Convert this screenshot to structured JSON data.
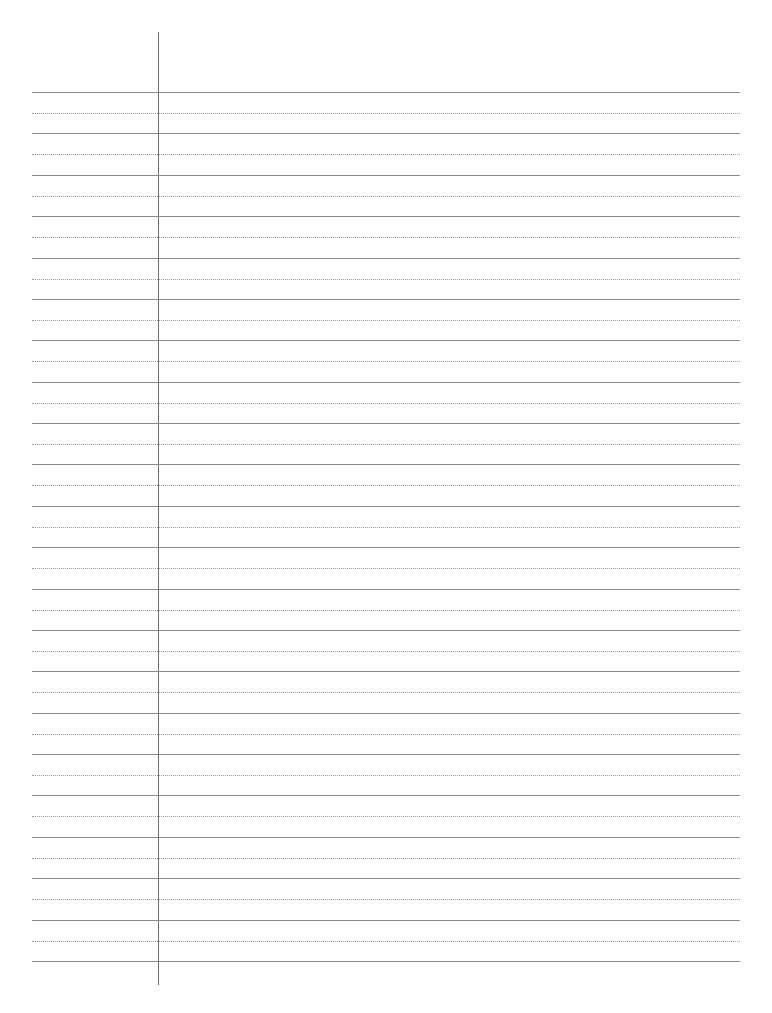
{
  "sheet": {
    "type": "lined-paper",
    "background_color": "#ffffff",
    "rule_color": "#8a8a8a",
    "dotted_rule_color": "#9a9a9a",
    "margin_line_color": "#6e6e6e",
    "solid_rule_count": 22,
    "dotted_rule_count": 21,
    "first_rule_y": 92,
    "rule_spacing": 41.38,
    "rule_left": 32,
    "rule_right": 740,
    "margin_line": {
      "x": 158,
      "top": 32,
      "bottom": 985
    }
  }
}
